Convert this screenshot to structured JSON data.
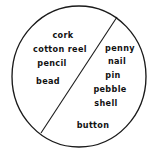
{
  "diagram": {
    "type": "circle-divided-by-chord",
    "shape_name": "circle",
    "divider_name": "chord-line",
    "stroke_color": "#1a1a1a",
    "fill_color": "#ffffff",
    "text_color": "#111111",
    "circle": {
      "center_x": 79,
      "center_y": 76.5,
      "radius_x": 67,
      "radius_y": 70.5
    },
    "chord": {
      "x1": 117,
      "y1": 17,
      "x2": 41,
      "y2": 133
    },
    "regions": [
      {
        "name": "left-region",
        "items": [
          {
            "label": "cork",
            "x": 63,
            "y": 35
          },
          {
            "label": "cotton reel",
            "x": 60,
            "y": 49
          },
          {
            "label": "pencil",
            "x": 52,
            "y": 63
          },
          {
            "label": "bead",
            "x": 48,
            "y": 81
          }
        ]
      },
      {
        "name": "right-region",
        "items": [
          {
            "label": "penny",
            "x": 120,
            "y": 48
          },
          {
            "label": "nail",
            "x": 117,
            "y": 61
          },
          {
            "label": "pin",
            "x": 113,
            "y": 75
          },
          {
            "label": "pebble",
            "x": 110,
            "y": 89
          },
          {
            "label": "shell",
            "x": 106,
            "y": 103
          },
          {
            "label": "button",
            "x": 93,
            "y": 125
          }
        ]
      }
    ]
  }
}
